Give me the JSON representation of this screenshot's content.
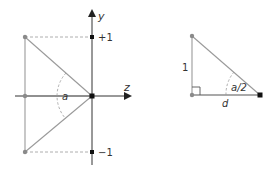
{
  "left_figure": {
    "axes": {
      "y_label": "y",
      "z_label": "z"
    },
    "ticks": {
      "plus_one": "+1",
      "minus_one": "−1"
    },
    "angle_label": "a"
  },
  "right_figure": {
    "side_label": "1",
    "base_label": "d",
    "angle_label": "a/2"
  },
  "colors": {
    "axis": "#333333",
    "triangle": "#9a9a9a",
    "dashed": "#9a9a9a",
    "point_gray": "#8a8a8a",
    "point_black": "#111111"
  }
}
